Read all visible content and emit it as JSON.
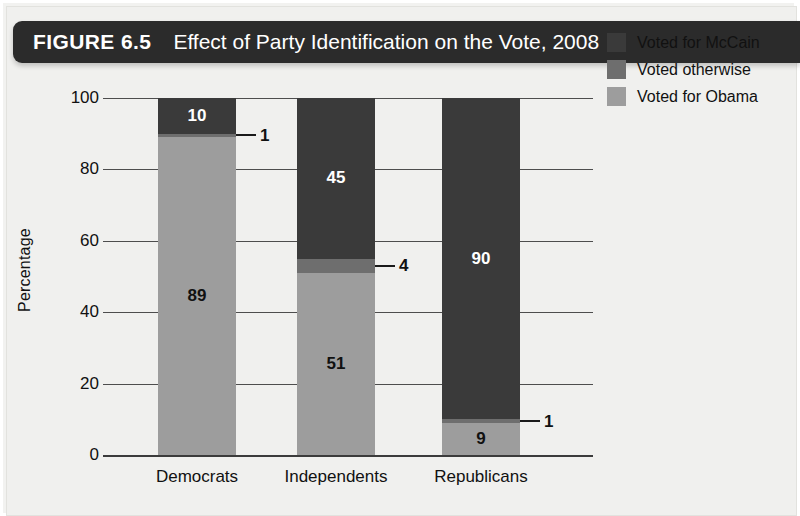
{
  "figure": {
    "label": "FIGURE 6.5",
    "title": "Effect of Party Identification on the Vote, 2008"
  },
  "chart_data": {
    "type": "bar",
    "subtype": "stacked-bar-100",
    "title": "Effect of Party Identification on the Vote, 2008",
    "xlabel": "",
    "ylabel": "Percentage",
    "ylim": [
      0,
      100
    ],
    "yticks": [
      0,
      20,
      40,
      60,
      80,
      100
    ],
    "grid": true,
    "legend_position": "top-right",
    "categories": [
      "Democrats",
      "Independents",
      "Republicans"
    ],
    "series": [
      {
        "name": "Voted for McCain",
        "color": "#3a3a3a",
        "values": [
          10,
          45,
          90
        ]
      },
      {
        "name": "Voted otherwise",
        "color": "#6e6e6e",
        "values": [
          1,
          4,
          1
        ]
      },
      {
        "name": "Voted for Obama",
        "color": "#9d9d9d",
        "values": [
          89,
          51,
          9
        ]
      }
    ],
    "stack_order_bottom_to_top": [
      "Voted for Obama",
      "Voted otherwise",
      "Voted for McCain"
    ],
    "annotations": [
      {
        "category": "Democrats",
        "series": "Voted otherwise",
        "value": 1,
        "style": "leader-line-right"
      },
      {
        "category": "Independents",
        "series": "Voted otherwise",
        "value": 4,
        "style": "leader-line-right"
      },
      {
        "category": "Republicans",
        "series": "Voted otherwise",
        "value": 1,
        "style": "leader-line-right"
      }
    ]
  },
  "yticks": [
    {
      "label": "100"
    },
    {
      "label": "80"
    },
    {
      "label": "60"
    },
    {
      "label": "40"
    },
    {
      "label": "20"
    },
    {
      "label": "0"
    }
  ],
  "bars": [
    {
      "category": "Democrats",
      "segments": [
        {
          "name": "Voted for McCain",
          "value": "10",
          "inside": true
        },
        {
          "name": "Voted otherwise",
          "value": "1",
          "inside": false
        },
        {
          "name": "Voted for Obama",
          "value": "89",
          "inside": true
        }
      ]
    },
    {
      "category": "Independents",
      "segments": [
        {
          "name": "Voted for McCain",
          "value": "45",
          "inside": true
        },
        {
          "name": "Voted otherwise",
          "value": "4",
          "inside": false
        },
        {
          "name": "Voted for Obama",
          "value": "51",
          "inside": true
        }
      ]
    },
    {
      "category": "Republicans",
      "segments": [
        {
          "name": "Voted for McCain",
          "value": "90",
          "inside": true
        },
        {
          "name": "Voted otherwise",
          "value": "1",
          "inside": false
        },
        {
          "name": "Voted for Obama",
          "value": "9",
          "inside": true
        }
      ]
    }
  ],
  "legend": {
    "items": [
      {
        "label": "Voted for McCain",
        "color": "#3a3a3a"
      },
      {
        "label": "Voted otherwise",
        "color": "#6e6e6e"
      },
      {
        "label": "Voted for Obama",
        "color": "#9d9d9d"
      }
    ]
  },
  "colors": {
    "mccain": "#3a3a3a",
    "otherwise": "#6e6e6e",
    "obama": "#9d9d9d",
    "banner": "#2b2b2b",
    "background": "#f0f0ee",
    "axis": "#3b3b3b"
  }
}
